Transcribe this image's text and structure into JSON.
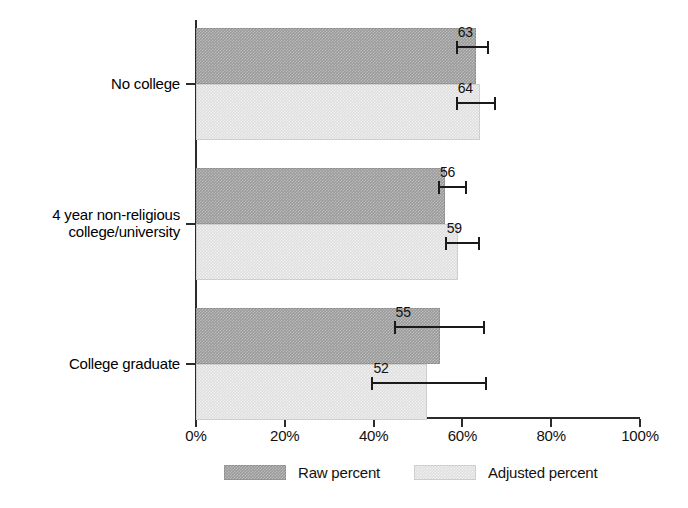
{
  "chart_data": {
    "type": "bar",
    "orientation": "horizontal",
    "title": "",
    "xlabel": "",
    "ylabel": "",
    "xlim": [
      0,
      100
    ],
    "xticks": [
      0,
      20,
      40,
      60,
      80,
      100
    ],
    "xtick_labels": [
      "0%",
      "20%",
      "40%",
      "60%",
      "80%",
      "100%"
    ],
    "grid": false,
    "legend_position": "bottom",
    "categories": [
      "No college",
      "4 year non-religious college/university",
      "College graduate"
    ],
    "category_label_lines": [
      [
        "No college"
      ],
      [
        "4 year non-religious",
        "college/university"
      ],
      [
        "College graduate"
      ]
    ],
    "series": [
      {
        "name": "Raw percent",
        "color": "#9a9a9a",
        "values": [
          63,
          56,
          55
        ],
        "value_labels": [
          "63",
          "56",
          "55"
        ],
        "error_low": [
          58.5,
          54.5,
          44.5
        ],
        "error_high": [
          66.0,
          61.0,
          65.0
        ]
      },
      {
        "name": "Adjusted percent",
        "color": "#dedede",
        "values": [
          64,
          59,
          52
        ],
        "value_labels": [
          "64",
          "59",
          "52"
        ],
        "error_low": [
          58.5,
          56.0,
          39.5
        ],
        "error_high": [
          67.5,
          64.0,
          65.5
        ]
      }
    ],
    "legend": [
      "Raw percent",
      "Adjusted percent"
    ]
  }
}
